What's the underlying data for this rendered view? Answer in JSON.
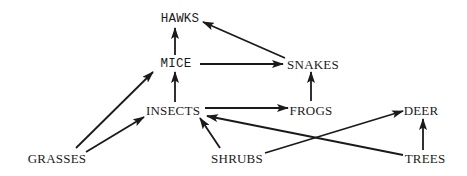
{
  "diagram": {
    "title": "",
    "type": "food-web",
    "colors": {
      "line": "#1a1a1a",
      "text": "#1a1a1a",
      "background": "#ffffff"
    },
    "nodes": [
      {
        "id": "hawks",
        "label": "HAWKS",
        "x": 180,
        "y": 19,
        "style": "mono"
      },
      {
        "id": "mice",
        "label": "MICE",
        "x": 176,
        "y": 64,
        "style": "mono"
      },
      {
        "id": "snakes",
        "label": "SNAKES",
        "x": 313,
        "y": 64,
        "style": "serif"
      },
      {
        "id": "insects",
        "label": "INSECTS",
        "x": 173,
        "y": 110,
        "style": "serif"
      },
      {
        "id": "frogs",
        "label": "FROGS",
        "x": 311,
        "y": 110,
        "style": "serif"
      },
      {
        "id": "deer",
        "label": "DEER",
        "x": 421,
        "y": 110,
        "style": "serif"
      },
      {
        "id": "grasses",
        "label": "GRASSES",
        "x": 57,
        "y": 158,
        "style": "serif"
      },
      {
        "id": "shrubs",
        "label": "SHRUBS",
        "x": 237,
        "y": 158,
        "style": "serif"
      },
      {
        "id": "trees",
        "label": "TREES",
        "x": 425,
        "y": 158,
        "style": "serif"
      }
    ],
    "edges": [
      {
        "from": "mice",
        "to": "hawks",
        "x1": 175,
        "y1": 55,
        "x2": 175,
        "y2": 28
      },
      {
        "from": "snakes",
        "to": "hawks",
        "x1": 285,
        "y1": 58,
        "x2": 203,
        "y2": 22
      },
      {
        "from": "mice",
        "to": "snakes",
        "x1": 200,
        "y1": 64,
        "x2": 283,
        "y2": 64
      },
      {
        "from": "insects",
        "to": "mice",
        "x1": 175,
        "y1": 102,
        "x2": 175,
        "y2": 72
      },
      {
        "from": "grasses",
        "to": "mice",
        "x1": 76,
        "y1": 148,
        "x2": 153,
        "y2": 72
      },
      {
        "from": "grasses",
        "to": "insects",
        "x1": 86,
        "y1": 152,
        "x2": 144,
        "y2": 117
      },
      {
        "from": "insects",
        "to": "frogs",
        "x1": 205,
        "y1": 108,
        "x2": 288,
        "y2": 108
      },
      {
        "from": "frogs",
        "to": "snakes",
        "x1": 311,
        "y1": 101,
        "x2": 311,
        "y2": 72
      },
      {
        "from": "shrubs",
        "to": "insects",
        "x1": 220,
        "y1": 148,
        "x2": 200,
        "y2": 118
      },
      {
        "from": "trees",
        "to": "insects",
        "x1": 403,
        "y1": 155,
        "x2": 207,
        "y2": 116
      },
      {
        "from": "shrubs",
        "to": "deer",
        "x1": 265,
        "y1": 153,
        "x2": 403,
        "y2": 111
      },
      {
        "from": "trees",
        "to": "deer",
        "x1": 423,
        "y1": 150,
        "x2": 423,
        "y2": 119
      }
    ]
  }
}
